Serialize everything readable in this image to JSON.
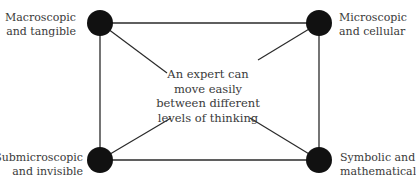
{
  "nodes": {
    "top_left": {
      "line1": "Macroscopic",
      "line2": "and tangible"
    },
    "top_right": {
      "line1": "Microscopic",
      "line2": "and cellular"
    },
    "bottom_left": {
      "line1": "Submicroscopic",
      "line2": "and invisible"
    },
    "bottom_right": {
      "line1": "Symbolic and",
      "line2": "mathematical"
    }
  },
  "center": {
    "line1": "An expert can",
    "line2": "move easily",
    "line3": "between different",
    "line4": "levels of thinking"
  },
  "colors": {
    "node_fill": "#111111",
    "line": "#2a2a2a",
    "text": "#3a3a3a",
    "background": "#ffffff"
  }
}
